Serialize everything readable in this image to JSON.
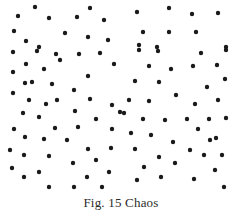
{
  "figure": {
    "caption": "Fig. 15 Chaos",
    "background_color": "#ffffff",
    "dot_color": "#1a1a1a",
    "caption_color": "#2b2b2b"
  },
  "chart_data": {
    "type": "scatter",
    "title": "Fig. 15 Chaos",
    "xlabel": "",
    "ylabel": "",
    "xlim": [
      0,
      242
    ],
    "ylim": [
      0,
      196
    ],
    "grid": false,
    "legend": null,
    "marker": {
      "shape": "circle",
      "diameter": 4.4,
      "color": "#1a1a1a"
    },
    "point_count": 110,
    "series": [
      {
        "name": "chaotic distribution",
        "color": "#1a1a1a",
        "points": [
          [
            35,
            7
          ],
          [
            90,
            8
          ],
          [
            169,
            8
          ],
          [
            218,
            13
          ],
          [
            137,
            12
          ],
          [
            192,
            14
          ],
          [
            18,
            16
          ],
          [
            77,
            17
          ],
          [
            49,
            18
          ],
          [
            104,
            20
          ],
          [
            14,
            31
          ],
          [
            65,
            33
          ],
          [
            143,
            32
          ],
          [
            169,
            32
          ],
          [
            196,
            32
          ],
          [
            26,
            41
          ],
          [
            88,
            37
          ],
          [
            108,
            40
          ],
          [
            39,
            47
          ],
          [
            157,
            47
          ],
          [
            226,
            47
          ],
          [
            139,
            45
          ],
          [
            13,
            52
          ],
          [
            37,
            51
          ],
          [
            56,
            54
          ],
          [
            79,
            54
          ],
          [
            100,
            53
          ],
          [
            139,
            50
          ],
          [
            158,
            51
          ],
          [
            201,
            53
          ],
          [
            226,
            50
          ],
          [
            26,
            64
          ],
          [
            44,
            69
          ],
          [
            114,
            64
          ],
          [
            149,
            66
          ],
          [
            171,
            69
          ],
          [
            193,
            66
          ],
          [
            217,
            65
          ],
          [
            13,
            72
          ],
          [
            25,
            83
          ],
          [
            32,
            82
          ],
          [
            52,
            84
          ],
          [
            88,
            76
          ],
          [
            135,
            81
          ],
          [
            159,
            82
          ],
          [
            225,
            79
          ],
          [
            207,
            87
          ],
          [
            13,
            93
          ],
          [
            74,
            90
          ],
          [
            29,
            100
          ],
          [
            57,
            100
          ],
          [
            90,
            99
          ],
          [
            129,
            100
          ],
          [
            149,
            101
          ],
          [
            218,
            100
          ],
          [
            195,
            104
          ],
          [
            23,
            113
          ],
          [
            39,
            117
          ],
          [
            112,
            105
          ],
          [
            75,
            111
          ],
          [
            120,
            112
          ],
          [
            124,
            113
          ],
          [
            143,
            119
          ],
          [
            165,
            120
          ],
          [
            187,
            119
          ],
          [
            209,
            119
          ],
          [
            226,
            118
          ],
          [
            14,
            129
          ],
          [
            55,
            128
          ],
          [
            96,
            119
          ],
          [
            78,
            127
          ],
          [
            112,
            129
          ],
          [
            131,
            133
          ],
          [
            151,
            135
          ],
          [
            198,
            129
          ],
          [
            25,
            137
          ],
          [
            44,
            139
          ],
          [
            67,
            140
          ],
          [
            173,
            142
          ],
          [
            216,
            138
          ],
          [
            10,
            150
          ],
          [
            24,
            155
          ],
          [
            49,
            156
          ],
          [
            88,
            149
          ],
          [
            111,
            148
          ],
          [
            135,
            149
          ],
          [
            190,
            150
          ],
          [
            204,
            155
          ],
          [
            222,
            155
          ],
          [
            12,
            168
          ],
          [
            39,
            172
          ],
          [
            73,
            163
          ],
          [
            109,
            172
          ],
          [
            144,
            167
          ],
          [
            159,
            157
          ],
          [
            175,
            163
          ],
          [
            215,
            170
          ],
          [
            24,
            177
          ],
          [
            87,
            177
          ],
          [
            137,
            180
          ],
          [
            161,
            177
          ],
          [
            194,
            179
          ],
          [
            49,
            187
          ],
          [
            74,
            187
          ],
          [
            102,
            187
          ],
          [
            224,
            187
          ],
          [
            60,
            60
          ],
          [
            176,
            95
          ],
          [
            96,
            160
          ],
          [
            210,
            140
          ],
          [
            46,
            104
          ]
        ]
      }
    ]
  }
}
